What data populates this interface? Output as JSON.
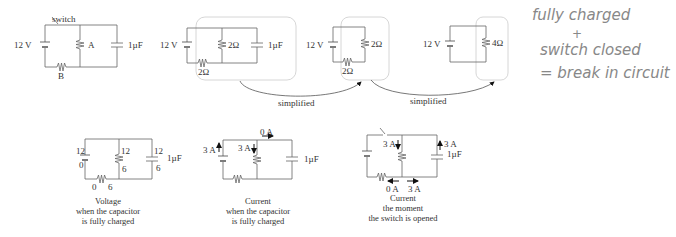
{
  "circuit_original": {
    "switch_label": "switch",
    "battery_label": "12 V",
    "resistor_a_label": "A",
    "resistor_b_label": "B",
    "capacitor_label": "1µF"
  },
  "circuit_step1": {
    "battery_label": "12 V",
    "parallel_resistor_label": "2Ω",
    "series_resistor_label": "2Ω",
    "capacitor_label": "1µF"
  },
  "circuit_step2": {
    "battery_label": "12 V",
    "resistor_label": "2Ω",
    "series_resistor_label": "2Ω"
  },
  "circuit_step3": {
    "battery_label": "12 V",
    "resistor_label": "4Ω"
  },
  "arrows": {
    "first_label": "simplified",
    "second_label": "simplified"
  },
  "handwritten_note": {
    "line1": "fully charged",
    "line2": "+",
    "line3": "switch closed",
    "line4": "= break in circuit"
  },
  "voltage_diagram": {
    "battery_top": "12",
    "battery_bottom": "0",
    "resistor_a_top": "12",
    "resistor_a_bottom": "6",
    "capacitor_top": "12",
    "capacitor_bottom": "6",
    "capacitor_label": "1µF",
    "resistor_b_left": "0",
    "resistor_b_right": "6",
    "caption_line1": "Voltage",
    "caption_line2": "when the capacitor",
    "caption_line3": "is fully charged"
  },
  "current_charged_diagram": {
    "battery_current": "3 A",
    "resistor_current": "3 A",
    "capacitor_branch_current": "0 A",
    "capacitor_label": "1µF",
    "caption_line1": "Current",
    "caption_line2": "when the capacitor",
    "caption_line3": "is fully charged"
  },
  "current_opened_diagram": {
    "resistor_current": "3 A",
    "capacitor_current": "3 A",
    "capacitor_label": "1µF",
    "bottom_left_current": "0 A",
    "bottom_right_current": "3 A",
    "caption_line1": "Current",
    "caption_line2": "the moment",
    "caption_line3": "the switch is opened"
  }
}
